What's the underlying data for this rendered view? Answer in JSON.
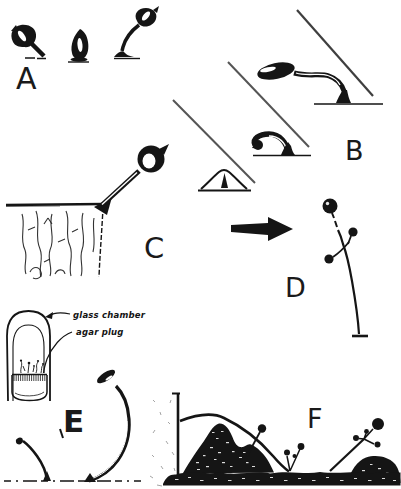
{
  "panels": {
    "a": {
      "label": "A"
    },
    "b": {
      "label": "B"
    },
    "c": {
      "label": "C"
    },
    "d": {
      "label": "D"
    },
    "e": {
      "label": "E",
      "annotations": {
        "glass_chamber": "glass chamber",
        "agar_plug": "agar plug"
      }
    },
    "f": {
      "label": "F"
    }
  },
  "colors": {
    "ink": "#151515",
    "paper": "#ffffff",
    "beam_line": "#4c4c4c",
    "speckle_gray": "#a5a5a5"
  }
}
